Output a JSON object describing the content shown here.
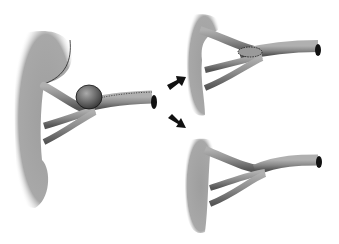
{
  "figure": {
    "panels": [
      {
        "id": "original",
        "label": "Kidney with saccular aneurysm at renal artery bifurcation"
      },
      {
        "id": "repair-patch",
        "label": "Repair with oval patch angioplasty at bifurcation"
      },
      {
        "id": "repair-resection",
        "label": "Repair by resection and primary closure"
      }
    ],
    "arrows": [
      {
        "id": "arrow-up",
        "direction": "up-right"
      },
      {
        "id": "arrow-down",
        "direction": "down-right"
      }
    ],
    "colors": {
      "kidney": "#9a9a9a",
      "vessel": "#8c8c8c",
      "outline": "#1a1a1a",
      "background": "#ffffff"
    }
  }
}
